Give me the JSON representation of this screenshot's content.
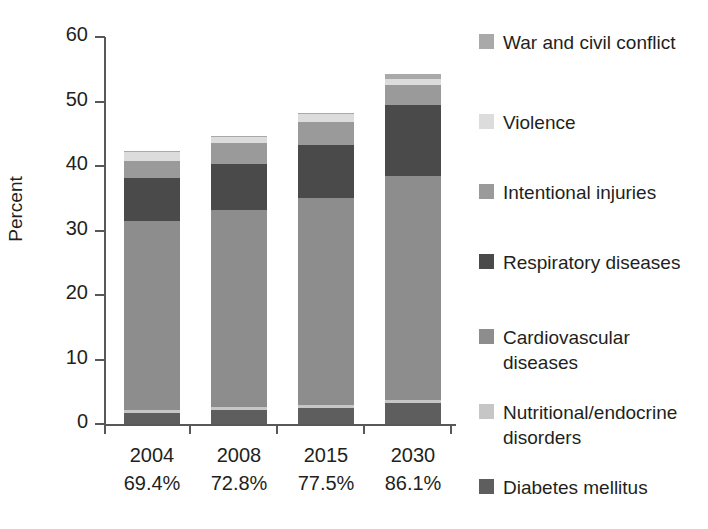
{
  "chart_data": {
    "type": "bar",
    "subtype": "stacked-vertical",
    "title": "",
    "xlabel": "",
    "ylabel": "Percent",
    "ylim": [
      0,
      60
    ],
    "yticks": [
      0,
      10,
      20,
      30,
      40,
      50,
      60
    ],
    "grid": false,
    "legend_position": "right",
    "categories": [
      "2004",
      "2008",
      "2015",
      "2030"
    ],
    "category_sublabels": [
      "69.4%",
      "72.8%",
      "77.5%",
      "86.1%"
    ],
    "series": [
      {
        "name": "Diabetes mellitus",
        "color": "#5e5e5e",
        "values": [
          1.7,
          2.2,
          2.5,
          3.2
        ]
      },
      {
        "name": "Nutritional/endocrine disorders",
        "color": "#c6c6c6",
        "values": [
          0.5,
          0.4,
          0.5,
          0.5
        ]
      },
      {
        "name": "Cardiovascular diseases",
        "color": "#8d8d8d",
        "values": [
          29.2,
          30.6,
          32.1,
          34.7
        ]
      },
      {
        "name": "Respiratory diseases",
        "color": "#4a4a4a",
        "values": [
          6.7,
          7.1,
          8.2,
          11.1
        ]
      },
      {
        "name": "Intentional injuries",
        "color": "#9a9a9a",
        "values": [
          2.7,
          3.2,
          3.6,
          3.1
        ]
      },
      {
        "name": "Violence",
        "color": "#dcdcdc",
        "values": [
          1.3,
          1.0,
          1.1,
          0.9
        ]
      },
      {
        "name": "War and civil conflict",
        "color": "#a9a9a9",
        "values": [
          0.2,
          0.2,
          0.2,
          0.8
        ]
      }
    ],
    "totals": [
      42.3,
      44.7,
      48.2,
      54.3
    ]
  },
  "axes": {
    "y_title": "Percent",
    "y_tick_labels": [
      "60",
      "50",
      "40",
      "30",
      "20",
      "10",
      "0"
    ]
  },
  "x_categories": [
    {
      "year": "2004",
      "pct": "69.4%"
    },
    {
      "year": "2008",
      "pct": "72.8%"
    },
    {
      "year": "2015",
      "pct": "77.5%"
    },
    {
      "year": "2030",
      "pct": "86.1%"
    }
  ],
  "legend": {
    "items": [
      {
        "label": "War and civil conflict",
        "color": "#a9a9a9"
      },
      {
        "label": "Violence",
        "color": "#dcdcdc"
      },
      {
        "label": "Intentional injuries",
        "color": "#9a9a9a"
      },
      {
        "label": "Respiratory diseases",
        "color": "#4a4a4a"
      },
      {
        "label": "Cardiovascular diseases",
        "color": "#8d8d8d"
      },
      {
        "label": "Nutritional/endocrine disorders",
        "color": "#c6c6c6"
      },
      {
        "label": "Diabetes mellitus",
        "color": "#5e5e5e"
      }
    ]
  }
}
